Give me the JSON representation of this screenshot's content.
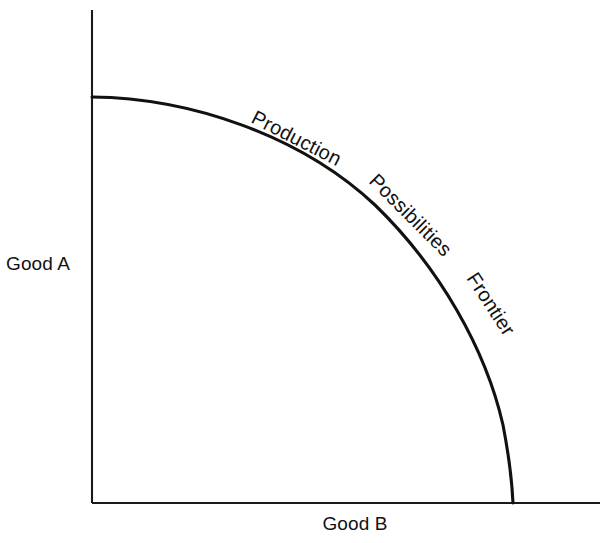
{
  "figure": {
    "title": "Production Possibilities Frontier",
    "background_color": "#ffffff",
    "line_color": "#111111",
    "text_color": "#121212"
  },
  "axes": {
    "y_axis_label": "Good A",
    "x_axis_label": "Good B",
    "y_axis": {
      "x": 92,
      "y_top": 10,
      "y_bottom": 503
    },
    "x_axis": {
      "y": 503,
      "x_left": 92,
      "x_right": 600
    }
  },
  "curve_labels": [
    {
      "text": "Production",
      "x": 250,
      "y": 122,
      "rotation": 27
    },
    {
      "text": "Possibilities",
      "x": 368,
      "y": 182,
      "rotation": 45
    },
    {
      "text": "Frontier",
      "x": 466,
      "y": 278,
      "rotation": 57
    }
  ],
  "chart_data": {
    "type": "line",
    "title": "Production Possibilities Frontier",
    "xlabel": "Good B",
    "ylabel": "Good A",
    "grid": false,
    "legend": "none",
    "axis_ticks": [],
    "annotations": [
      "Production",
      "Possibilities",
      "Frontier"
    ],
    "xlim": [
      0,
      1
    ],
    "ylim": [
      0,
      1
    ],
    "series": [
      {
        "name": "Production Possibilities Frontier",
        "x": [
          0.0,
          0.1,
          0.2,
          0.3,
          0.4,
          0.5,
          0.6,
          0.7,
          0.8,
          0.9,
          0.95,
          1.0
        ],
        "y": [
          1.0,
          0.995,
          0.979,
          0.954,
          0.917,
          0.866,
          0.8,
          0.714,
          0.6,
          0.436,
          0.312,
          0.0
        ]
      }
    ],
    "curve_pixel_path": {
      "start": [
        92,
        97
      ],
      "end": [
        513,
        503
      ],
      "control_points": [
        [
          92,
          97
        ],
        [
          265,
          103
        ],
        [
          430,
          235
        ],
        [
          513,
          503
        ]
      ]
    }
  }
}
